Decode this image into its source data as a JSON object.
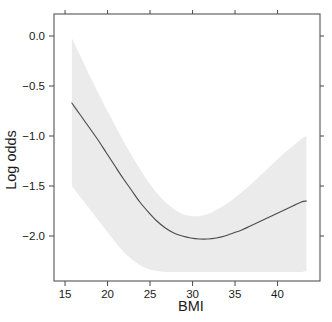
{
  "chart_data": {
    "type": "line",
    "title": "",
    "xlabel": "BMI",
    "ylabel": "Log odds",
    "xlim": [
      13.7,
      45.0
    ],
    "ylim": [
      -2.45,
      0.22
    ],
    "grid": false,
    "legend": "none",
    "xticks": [
      15,
      20,
      25,
      30,
      35,
      40
    ],
    "xtick_labels": [
      "15",
      "20",
      "25",
      "30",
      "35",
      "40"
    ],
    "yticks": [
      0.0,
      -0.5,
      -1.0,
      -1.5,
      -2.0
    ],
    "ytick_labels": [
      "0.0",
      "-0.5",
      "-1.0",
      "-1.5",
      "-2.0"
    ],
    "series": [
      {
        "name": "Log odds fit",
        "type": "line",
        "color": "#4d4d4d",
        "x": [
          15.8,
          16.8,
          17.8,
          18.8,
          19.8,
          20.8,
          21.8,
          22.8,
          23.8,
          24.8,
          25.8,
          26.8,
          27.8,
          28.8,
          29.8,
          30.8,
          31.8,
          32.8,
          33.8,
          34.8,
          35.8,
          36.8,
          37.8,
          38.8,
          39.8,
          40.8,
          41.8,
          42.8,
          43.4
        ],
        "values": [
          -0.67,
          -0.79,
          -0.91,
          -1.03,
          -1.16,
          -1.29,
          -1.42,
          -1.54,
          -1.66,
          -1.76,
          -1.85,
          -1.92,
          -1.97,
          -2.0,
          -2.02,
          -2.03,
          -2.03,
          -2.02,
          -2.0,
          -1.97,
          -1.94,
          -1.9,
          -1.86,
          -1.82,
          -1.78,
          -1.74,
          -1.7,
          -1.66,
          -1.65
        ]
      },
      {
        "name": "Confidence band",
        "type": "area",
        "color": "#ebebeb",
        "x": [
          15.8,
          16.8,
          17.8,
          18.8,
          19.8,
          20.8,
          21.8,
          22.8,
          23.8,
          24.8,
          25.8,
          26.8,
          27.8,
          28.8,
          29.8,
          30.8,
          31.8,
          32.8,
          33.8,
          34.8,
          35.8,
          36.8,
          37.8,
          38.8,
          39.8,
          40.8,
          41.8,
          42.8,
          43.4
        ],
        "upper": [
          -0.02,
          -0.2,
          -0.38,
          -0.55,
          -0.72,
          -0.88,
          -1.04,
          -1.19,
          -1.33,
          -1.46,
          -1.57,
          -1.66,
          -1.73,
          -1.78,
          -1.8,
          -1.8,
          -1.78,
          -1.74,
          -1.69,
          -1.63,
          -1.56,
          -1.49,
          -1.41,
          -1.33,
          -1.25,
          -1.17,
          -1.1,
          -1.03,
          -1.0
        ],
        "lower": [
          -1.5,
          -1.61,
          -1.72,
          -1.83,
          -1.94,
          -2.05,
          -2.15,
          -2.23,
          -2.29,
          -2.33,
          -2.35,
          -2.36,
          -2.36,
          -2.36,
          -2.36,
          -2.36,
          -2.36,
          -2.36,
          -2.36,
          -2.36,
          -2.36,
          -2.36,
          -2.36,
          -2.36,
          -2.36,
          -2.36,
          -2.36,
          -2.36,
          -2.35
        ]
      }
    ],
    "annotations": []
  }
}
